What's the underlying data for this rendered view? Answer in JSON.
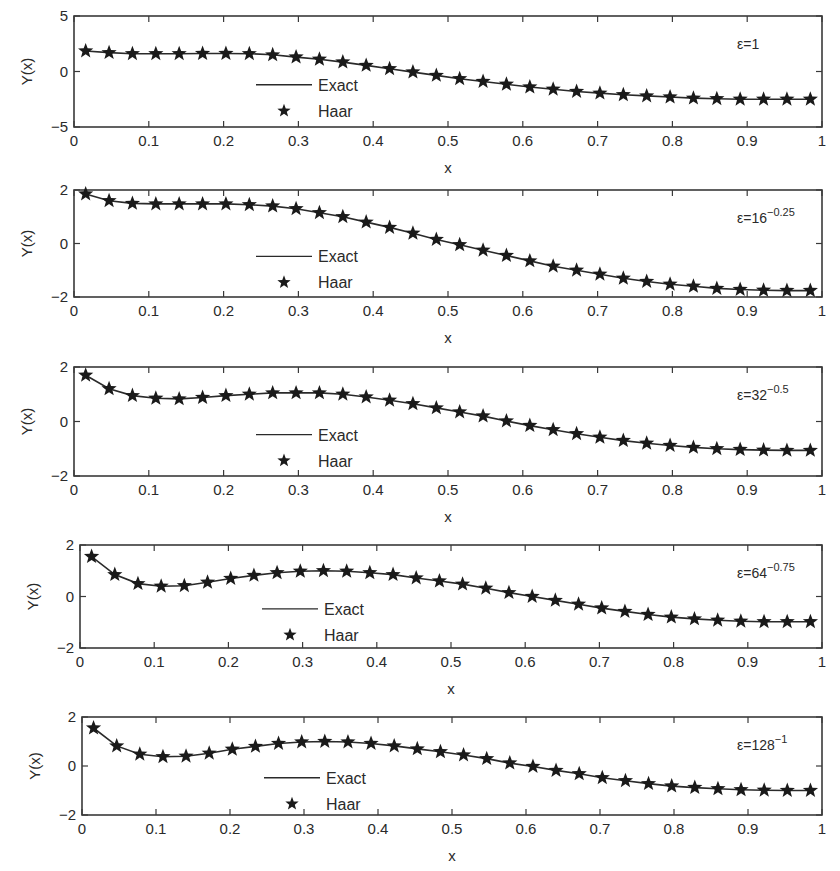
{
  "figure": {
    "ylabel": "Y(x)",
    "xlabel": "x",
    "legend": {
      "exact": "Exact",
      "haar": "Haar"
    },
    "x_ticks": [
      "0",
      "0.1",
      "0.2",
      "0.3",
      "0.4",
      "0.5",
      "0.6",
      "0.7",
      "0.8",
      "0.9",
      "1"
    ],
    "colors": {
      "line": "#2a2a2a",
      "marker": "#1a1a1a",
      "axes": "#3a3a3a",
      "background": "#ffffff"
    }
  },
  "chart_data": [
    {
      "type": "line",
      "title": "",
      "annotation": {
        "base": "ε=1",
        "exp": ""
      },
      "xlabel": "x",
      "ylabel": "Y(x)",
      "xlim": [
        0,
        1
      ],
      "ylim": [
        -5,
        5
      ],
      "y_ticks": [
        "-5",
        "0",
        "5"
      ],
      "grid": false,
      "legend_position": "center-left",
      "x": [
        0.0156,
        0.0469,
        0.0781,
        0.1094,
        0.1406,
        0.1719,
        0.2031,
        0.2344,
        0.2656,
        0.2969,
        0.3281,
        0.3594,
        0.3906,
        0.4219,
        0.4531,
        0.4844,
        0.5156,
        0.5469,
        0.5781,
        0.6094,
        0.6406,
        0.6719,
        0.7031,
        0.7344,
        0.7656,
        0.7969,
        0.8281,
        0.8594,
        0.8906,
        0.9219,
        0.9531,
        0.9844
      ],
      "series": [
        {
          "name": "Exact",
          "style": "line",
          "values": [
            1.85,
            1.7,
            1.6,
            1.6,
            1.6,
            1.62,
            1.62,
            1.6,
            1.5,
            1.3,
            1.1,
            0.85,
            0.55,
            0.25,
            -0.05,
            -0.35,
            -0.65,
            -0.9,
            -1.15,
            -1.4,
            -1.6,
            -1.8,
            -1.95,
            -2.1,
            -2.2,
            -2.3,
            -2.4,
            -2.45,
            -2.5,
            -2.5,
            -2.5,
            -2.5
          ]
        },
        {
          "name": "Haar",
          "style": "star",
          "values": [
            1.85,
            1.7,
            1.6,
            1.6,
            1.6,
            1.62,
            1.62,
            1.6,
            1.5,
            1.3,
            1.1,
            0.85,
            0.55,
            0.25,
            -0.05,
            -0.35,
            -0.65,
            -0.9,
            -1.15,
            -1.4,
            -1.6,
            -1.8,
            -1.95,
            -2.1,
            -2.2,
            -2.3,
            -2.4,
            -2.45,
            -2.5,
            -2.5,
            -2.5,
            -2.5
          ]
        }
      ]
    },
    {
      "type": "line",
      "title": "",
      "annotation": {
        "base": "ε=16",
        "exp": "−0.25"
      },
      "xlabel": "x",
      "ylabel": "Y(x)",
      "xlim": [
        0,
        1
      ],
      "ylim": [
        -2,
        2
      ],
      "y_ticks": [
        "-2",
        "0",
        "2"
      ],
      "grid": false,
      "legend_position": "center-left",
      "x": [
        0.0156,
        0.0469,
        0.0781,
        0.1094,
        0.1406,
        0.1719,
        0.2031,
        0.2344,
        0.2656,
        0.2969,
        0.3281,
        0.3594,
        0.3906,
        0.4219,
        0.4531,
        0.4844,
        0.5156,
        0.5469,
        0.5781,
        0.6094,
        0.6406,
        0.6719,
        0.7031,
        0.7344,
        0.7656,
        0.7969,
        0.8281,
        0.8594,
        0.8906,
        0.9219,
        0.9531,
        0.9844
      ],
      "series": [
        {
          "name": "Exact",
          "style": "line",
          "values": [
            1.85,
            1.6,
            1.5,
            1.48,
            1.48,
            1.48,
            1.48,
            1.45,
            1.4,
            1.3,
            1.15,
            1.0,
            0.8,
            0.6,
            0.38,
            0.15,
            -0.05,
            -0.25,
            -0.45,
            -0.65,
            -0.85,
            -1.0,
            -1.15,
            -1.3,
            -1.42,
            -1.52,
            -1.6,
            -1.68,
            -1.72,
            -1.75,
            -1.76,
            -1.76
          ]
        },
        {
          "name": "Haar",
          "style": "star",
          "values": [
            1.85,
            1.6,
            1.5,
            1.48,
            1.48,
            1.48,
            1.48,
            1.45,
            1.4,
            1.3,
            1.15,
            1.0,
            0.8,
            0.6,
            0.38,
            0.15,
            -0.05,
            -0.25,
            -0.45,
            -0.65,
            -0.85,
            -1.0,
            -1.15,
            -1.3,
            -1.42,
            -1.52,
            -1.6,
            -1.68,
            -1.72,
            -1.75,
            -1.76,
            -1.76
          ]
        }
      ]
    },
    {
      "type": "line",
      "title": "",
      "annotation": {
        "base": "ε=32",
        "exp": "−0.5"
      },
      "xlabel": "x",
      "ylabel": "Y(x)",
      "xlim": [
        0,
        1
      ],
      "ylim": [
        -2,
        2
      ],
      "y_ticks": [
        "-2",
        "0",
        "2"
      ],
      "grid": false,
      "legend_position": "center-left",
      "x": [
        0.0156,
        0.0469,
        0.0781,
        0.1094,
        0.1406,
        0.1719,
        0.2031,
        0.2344,
        0.2656,
        0.2969,
        0.3281,
        0.3594,
        0.3906,
        0.4219,
        0.4531,
        0.4844,
        0.5156,
        0.5469,
        0.5781,
        0.6094,
        0.6406,
        0.6719,
        0.7031,
        0.7344,
        0.7656,
        0.7969,
        0.8281,
        0.8594,
        0.8906,
        0.9219,
        0.9531,
        0.9844
      ],
      "series": [
        {
          "name": "Exact",
          "style": "line",
          "values": [
            1.7,
            1.2,
            0.95,
            0.85,
            0.83,
            0.88,
            0.95,
            1.0,
            1.05,
            1.05,
            1.05,
            1.0,
            0.9,
            0.78,
            0.65,
            0.5,
            0.35,
            0.2,
            0.02,
            -0.15,
            -0.3,
            -0.45,
            -0.58,
            -0.7,
            -0.8,
            -0.88,
            -0.95,
            -1.0,
            -1.03,
            -1.05,
            -1.06,
            -1.06
          ]
        },
        {
          "name": "Haar",
          "style": "star",
          "values": [
            1.7,
            1.2,
            0.95,
            0.85,
            0.83,
            0.88,
            0.95,
            1.0,
            1.05,
            1.05,
            1.05,
            1.0,
            0.9,
            0.78,
            0.65,
            0.5,
            0.35,
            0.2,
            0.02,
            -0.15,
            -0.3,
            -0.45,
            -0.58,
            -0.7,
            -0.8,
            -0.88,
            -0.95,
            -1.0,
            -1.03,
            -1.05,
            -1.06,
            -1.06
          ]
        }
      ]
    },
    {
      "type": "line",
      "title": "",
      "annotation": {
        "base": "ε=64",
        "exp": "−0.75"
      },
      "xlabel": "x",
      "ylabel": "Y(x)",
      "xlim": [
        0,
        1
      ],
      "ylim": [
        -2,
        2
      ],
      "y_ticks": [
        "-2",
        "0",
        "2"
      ],
      "grid": false,
      "legend_position": "center-left",
      "x": [
        0.0156,
        0.0469,
        0.0781,
        0.1094,
        0.1406,
        0.1719,
        0.2031,
        0.2344,
        0.2656,
        0.2969,
        0.3281,
        0.3594,
        0.3906,
        0.4219,
        0.4531,
        0.4844,
        0.5156,
        0.5469,
        0.5781,
        0.6094,
        0.6406,
        0.6719,
        0.7031,
        0.7344,
        0.7656,
        0.7969,
        0.8281,
        0.8594,
        0.8906,
        0.9219,
        0.9531,
        0.9844
      ],
      "series": [
        {
          "name": "Exact",
          "style": "line",
          "values": [
            1.55,
            0.85,
            0.5,
            0.4,
            0.42,
            0.55,
            0.7,
            0.82,
            0.92,
            0.98,
            1.0,
            0.98,
            0.92,
            0.85,
            0.72,
            0.6,
            0.48,
            0.32,
            0.15,
            0.0,
            -0.15,
            -0.3,
            -0.45,
            -0.58,
            -0.7,
            -0.8,
            -0.87,
            -0.92,
            -0.96,
            -0.98,
            -0.98,
            -0.98
          ]
        },
        {
          "name": "Haar",
          "style": "star",
          "values": [
            1.55,
            0.85,
            0.5,
            0.4,
            0.42,
            0.55,
            0.7,
            0.82,
            0.92,
            0.98,
            1.0,
            0.98,
            0.92,
            0.85,
            0.72,
            0.6,
            0.48,
            0.32,
            0.15,
            0.0,
            -0.15,
            -0.3,
            -0.45,
            -0.58,
            -0.7,
            -0.8,
            -0.87,
            -0.92,
            -0.96,
            -0.98,
            -0.98,
            -0.98
          ]
        }
      ]
    },
    {
      "type": "line",
      "title": "",
      "annotation": {
        "base": "ε=128",
        "exp": "−1"
      },
      "xlabel": "x",
      "ylabel": "Y(x)",
      "xlim": [
        0,
        1
      ],
      "ylim": [
        -2,
        2
      ],
      "y_ticks": [
        "-2",
        "0",
        "2"
      ],
      "grid": false,
      "legend_position": "center-left",
      "x": [
        0.0156,
        0.0469,
        0.0781,
        0.1094,
        0.1406,
        0.1719,
        0.2031,
        0.2344,
        0.2656,
        0.2969,
        0.3281,
        0.3594,
        0.3906,
        0.4219,
        0.4531,
        0.4844,
        0.5156,
        0.5469,
        0.5781,
        0.6094,
        0.6406,
        0.6719,
        0.7031,
        0.7344,
        0.7656,
        0.7969,
        0.8281,
        0.8594,
        0.8906,
        0.9219,
        0.9531,
        0.9844
      ],
      "series": [
        {
          "name": "Exact",
          "style": "line",
          "values": [
            1.55,
            0.82,
            0.48,
            0.38,
            0.4,
            0.52,
            0.68,
            0.8,
            0.92,
            0.98,
            1.0,
            0.98,
            0.92,
            0.82,
            0.7,
            0.58,
            0.45,
            0.3,
            0.12,
            -0.02,
            -0.18,
            -0.32,
            -0.48,
            -0.6,
            -0.72,
            -0.82,
            -0.88,
            -0.93,
            -0.97,
            -0.99,
            -1.0,
            -1.0
          ]
        },
        {
          "name": "Haar",
          "style": "star",
          "values": [
            1.55,
            0.82,
            0.48,
            0.38,
            0.4,
            0.52,
            0.68,
            0.8,
            0.92,
            0.98,
            1.0,
            0.98,
            0.92,
            0.82,
            0.7,
            0.58,
            0.45,
            0.3,
            0.12,
            -0.02,
            -0.18,
            -0.32,
            -0.48,
            -0.6,
            -0.72,
            -0.82,
            -0.88,
            -0.93,
            -0.97,
            -0.99,
            -1.0,
            -1.0
          ]
        }
      ]
    }
  ]
}
